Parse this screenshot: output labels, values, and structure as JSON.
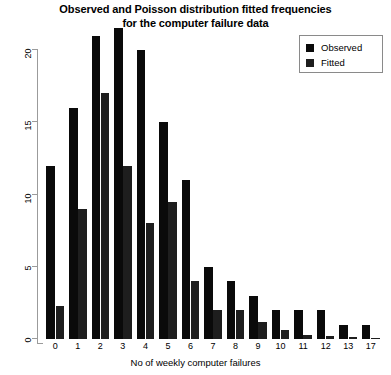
{
  "chart_data": {
    "type": "bar",
    "title": "Observed and Poisson distribution fitted frequencies for the computer failure data",
    "title_lines": [
      "Observed and Poisson distribution fitted frequencies",
      "for the computer failure data"
    ],
    "xlabel": "No of weekly computer failures",
    "ylabel": "",
    "categories": [
      "0",
      "1",
      "2",
      "3",
      "4",
      "5",
      "6",
      "7",
      "8",
      "9",
      "10",
      "11",
      "12",
      "13",
      "17"
    ],
    "series": [
      {
        "name": "Observed",
        "color": "#0a0a0a",
        "values": [
          12,
          16,
          21,
          21.5,
          20,
          15,
          11,
          5,
          4,
          3,
          2,
          2,
          2,
          1,
          1
        ]
      },
      {
        "name": "Fitted",
        "color": "#1e1e1e",
        "values": [
          2.3,
          9,
          17,
          12,
          8,
          9.5,
          4,
          2,
          2,
          1.2,
          0.6,
          0.3,
          0.2,
          0.15,
          0.1
        ]
      }
    ],
    "ylim": [
      0,
      21.8
    ],
    "yticks": [
      0,
      5,
      10,
      15,
      20
    ],
    "ytick_labels": [
      "0",
      "5",
      "10",
      "15",
      "20"
    ],
    "grid": false,
    "legend_position": "top-right",
    "legend_entries": [
      "Observed",
      "Fitted"
    ]
  }
}
